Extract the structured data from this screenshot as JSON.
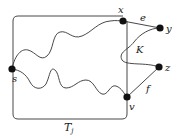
{
  "diagram": {
    "type": "graph-illustration",
    "colors": {
      "stroke": "#333333",
      "node": "#111111",
      "background": "#ffffff"
    },
    "region": {
      "label": "T",
      "subscript": "j",
      "shape": "rounded-rectangle"
    },
    "nodes": [
      {
        "id": "s",
        "label": "s"
      },
      {
        "id": "x",
        "label": "x"
      },
      {
        "id": "y",
        "label": "y"
      },
      {
        "id": "z",
        "label": "z"
      },
      {
        "id": "v",
        "label": "v"
      }
    ],
    "edges": [
      {
        "from": "x",
        "to": "y",
        "label": "e"
      },
      {
        "from": "v",
        "to": "z",
        "label": "f"
      },
      {
        "from": "y",
        "to": "z",
        "label": "K",
        "style": "curved path"
      },
      {
        "from": "s",
        "to": "x",
        "label": "",
        "style": "wavy path"
      },
      {
        "from": "s",
        "to": "v",
        "label": "",
        "style": "wavy path"
      }
    ],
    "labels": {
      "s": "s",
      "x": "x",
      "y": "y",
      "z": "z",
      "v": "v",
      "e": "e",
      "f": "f",
      "K": "K",
      "T": "T",
      "T_sub": "j"
    }
  }
}
